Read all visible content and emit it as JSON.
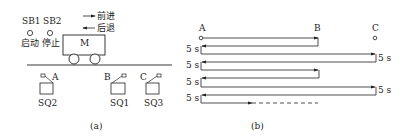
{
  "panel_a": {
    "caption": "(a)",
    "buttons": [
      {
        "id": "SB1",
        "label": "启动"
      },
      {
        "id": "SB2",
        "label": "停止"
      }
    ],
    "direction_legend": {
      "forward": "前进",
      "backward": "后退"
    },
    "cart_label": "M",
    "positions": [
      {
        "point": "A",
        "switch": "SQ2"
      },
      {
        "point": "B",
        "switch": "SQ1"
      },
      {
        "point": "C",
        "switch": "SQ3"
      }
    ]
  },
  "panel_b": {
    "caption": "(b)",
    "points": [
      "A",
      "B",
      "C"
    ],
    "delay_label": "5 s",
    "sequence": [
      {
        "dir": "forward",
        "from": "A",
        "to": "B"
      },
      {
        "dir": "backward",
        "from": "B",
        "to": "A",
        "wait_at_A": "5 s"
      },
      {
        "dir": "forward",
        "from": "A",
        "to": "C",
        "wait_at_C": "5 s"
      },
      {
        "dir": "backward",
        "from": "C",
        "to": "A",
        "wait_at_A": "5 s"
      },
      {
        "dir": "forward",
        "from": "A",
        "to": "B"
      },
      {
        "dir": "backward",
        "from": "B",
        "to": "A",
        "wait_at_A": "5 s"
      },
      {
        "dir": "forward",
        "from": "A",
        "to": "C",
        "wait_at_C": "5 s"
      },
      {
        "dir": "backward",
        "from": "C",
        "to": "A",
        "wait_at_A": "5 s"
      },
      {
        "dir": "forward",
        "from": "A",
        "to": "...",
        "continues": true
      }
    ]
  }
}
